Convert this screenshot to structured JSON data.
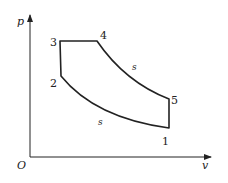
{
  "diagram": {
    "type": "p-v diagram",
    "axes": {
      "y_label": "p",
      "x_label": "v",
      "origin_label": "O"
    },
    "points": [
      {
        "id": "1",
        "label": "1",
        "x": 169,
        "y": 128
      },
      {
        "id": "2",
        "label": "2",
        "x": 61,
        "y": 76
      },
      {
        "id": "3",
        "label": "3",
        "x": 60,
        "y": 41
      },
      {
        "id": "4",
        "label": "4",
        "x": 97,
        "y": 41
      },
      {
        "id": "5",
        "label": "5",
        "x": 169,
        "y": 99
      }
    ],
    "process_labels": {
      "compression": "s",
      "expansion": "s"
    }
  }
}
